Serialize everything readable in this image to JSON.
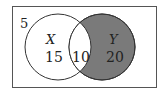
{
  "diagram": {
    "type": "venn",
    "universe_count": "5",
    "sets": [
      {
        "name": "X",
        "only_count": "15",
        "shaded": false
      },
      {
        "name": "Y",
        "only_count": "20",
        "shaded": true
      }
    ],
    "intersection_count": "10",
    "colors": {
      "shade": "#7a7a7a",
      "stroke": "#333333",
      "background": "#ffffff"
    }
  }
}
